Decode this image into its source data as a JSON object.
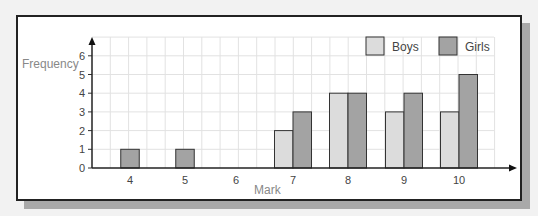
{
  "chart_data": {
    "type": "bar",
    "title": "",
    "xlabel": "Mark",
    "ylabel": "Frequency",
    "categories": [
      "4",
      "5",
      "6",
      "7",
      "8",
      "9",
      "10"
    ],
    "series": [
      {
        "name": "Boys",
        "values": [
          0,
          0,
          0,
          2,
          4,
          3,
          3
        ],
        "color": "#dcdcdc"
      },
      {
        "name": "Girls",
        "values": [
          1,
          1,
          0,
          3,
          4,
          4,
          5
        ],
        "color": "#a3a3a3"
      }
    ],
    "yticks": [
      "0",
      "1",
      "2",
      "3",
      "4",
      "5",
      "6"
    ],
    "ylim": [
      0,
      7
    ],
    "grid": true,
    "legend_position": "top-right"
  }
}
